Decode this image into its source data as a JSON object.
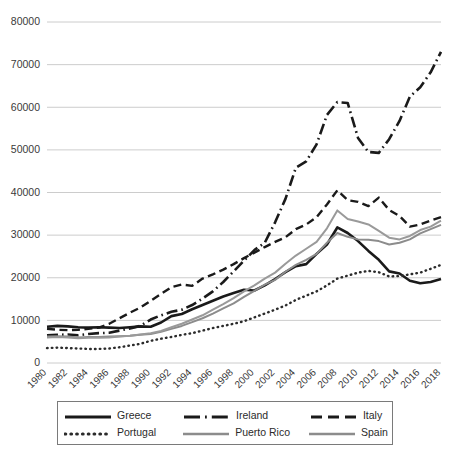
{
  "chart_data": {
    "type": "line",
    "title": "",
    "subtitle": "",
    "xlabel": "",
    "ylabel": "",
    "xlim": [
      1980,
      2018
    ],
    "ylim": [
      0,
      80000
    ],
    "grid": true,
    "legend_position": "bottom",
    "ytick_labels": [
      "80000",
      "70000",
      "60000",
      "50000",
      "40000",
      "30000",
      "20000",
      "10000",
      "0"
    ],
    "ytick_values": [
      80000,
      70000,
      60000,
      50000,
      40000,
      30000,
      20000,
      10000,
      0
    ],
    "xtick_labels": [
      "1980",
      "1982",
      "1984",
      "1986",
      "1988",
      "1990",
      "1992",
      "1994",
      "1996",
      "1998",
      "2000",
      "2002",
      "2004",
      "2006",
      "2008",
      "2010",
      "2012",
      "2014",
      "2016",
      "2018"
    ],
    "x": [
      1980,
      1981,
      1982,
      1983,
      1984,
      1985,
      1986,
      1987,
      1988,
      1989,
      1990,
      1991,
      1992,
      1993,
      1994,
      1995,
      1996,
      1997,
      1998,
      1999,
      2000,
      2001,
      2002,
      2003,
      2004,
      2005,
      2006,
      2007,
      2008,
      2009,
      2010,
      2011,
      2012,
      2013,
      2014,
      2015,
      2016,
      2017,
      2018
    ],
    "series": [
      {
        "name": "Greece",
        "line_style": "solid-thick",
        "color": "#1a1a1a",
        "values": [
          8500,
          8700,
          8600,
          8400,
          8300,
          8400,
          8300,
          8200,
          8400,
          8600,
          8500,
          9500,
          11000,
          11500,
          12600,
          13600,
          14600,
          15600,
          16400,
          17200,
          17000,
          18200,
          19700,
          21300,
          22700,
          23200,
          25600,
          27800,
          31800,
          30500,
          28600,
          26300,
          24200,
          21500,
          21000,
          19300,
          18700,
          19000,
          19700
        ]
      },
      {
        "name": "Ireland",
        "line_style": "dash-dot",
        "color": "#1a1a1a",
        "values": [
          6500,
          6600,
          6700,
          6500,
          6800,
          7000,
          7100,
          7600,
          8100,
          8700,
          10200,
          11200,
          12000,
          12500,
          13600,
          15100,
          16800,
          19000,
          21500,
          24000,
          26500,
          28200,
          33000,
          38500,
          45800,
          47300,
          51300,
          58200,
          61200,
          61000,
          52800,
          49500,
          49300,
          52500,
          56800,
          62500,
          64700,
          68200,
          73000
        ]
      },
      {
        "name": "Italy",
        "line_style": "dashed",
        "color": "#1a1a1a",
        "values": [
          8000,
          7800,
          7700,
          7800,
          8000,
          8300,
          9200,
          10500,
          11800,
          13000,
          14600,
          16200,
          17800,
          18400,
          18100,
          19800,
          20800,
          21900,
          23200,
          24600,
          25900,
          27200,
          28400,
          29500,
          31400,
          32500,
          34200,
          37200,
          40500,
          38200,
          37800,
          36800,
          38800,
          35900,
          34500,
          32000,
          32500,
          33400,
          34200
        ]
      },
      {
        "name": "Portugal",
        "line_style": "dotted",
        "color": "#2b2b2b",
        "values": [
          3500,
          3600,
          3500,
          3400,
          3300,
          3300,
          3400,
          3700,
          4100,
          4500,
          5200,
          5700,
          6100,
          6600,
          7000,
          7600,
          8200,
          8700,
          9200,
          9800,
          10700,
          11600,
          12500,
          13500,
          14800,
          15800,
          16800,
          18200,
          19800,
          20500,
          21200,
          21600,
          21300,
          20300,
          20400,
          20800,
          21200,
          22100,
          23000
        ]
      },
      {
        "name": "Puerto Rico",
        "line_style": "solid-thin-gray",
        "color": "#8c8c8c",
        "values": [
          6200,
          6300,
          6200,
          6000,
          6100,
          6100,
          6200,
          6300,
          6400,
          6600,
          6800,
          7300,
          8000,
          8700,
          9600,
          10500,
          11600,
          12800,
          14000,
          15500,
          16900,
          18400,
          19500,
          21400,
          23000,
          24200,
          25600,
          28200,
          30500,
          29600,
          29000,
          28900,
          28600,
          27800,
          28200,
          29000,
          30400,
          31400,
          32400
        ]
      },
      {
        "name": "Spain",
        "line_style": "solid-thin-gray",
        "color": "#9a9a9a",
        "values": [
          6000,
          6100,
          6000,
          5800,
          5900,
          5900,
          6000,
          6200,
          6400,
          6700,
          7000,
          7500,
          8400,
          9200,
          10200,
          11200,
          12500,
          13800,
          15200,
          16800,
          18200,
          19800,
          21200,
          23300,
          25200,
          26800,
          28400,
          31600,
          35800,
          33800,
          33200,
          32500,
          31000,
          29400,
          29000,
          29800,
          31200,
          32000,
          33400
        ]
      }
    ]
  },
  "legend": {
    "items": [
      {
        "label": "Greece",
        "swatch": "solid-thick-black"
      },
      {
        "label": "Ireland",
        "swatch": "dash-dot-black"
      },
      {
        "label": "Italy",
        "swatch": "dashed-black"
      },
      {
        "label": "Portugal",
        "swatch": "dotted-black"
      },
      {
        "label": "Puerto Rico",
        "swatch": "solid-thin-gray"
      },
      {
        "label": "Spain",
        "swatch": "solid-thin-gray"
      }
    ]
  },
  "colors": {
    "gridline": "#bfbfbf",
    "text": "#2b2b2b",
    "dark_series": "#1a1a1a",
    "gray_series": "#8c8c8c",
    "legend_border": "#7a7a7a",
    "background": "#ffffff"
  }
}
